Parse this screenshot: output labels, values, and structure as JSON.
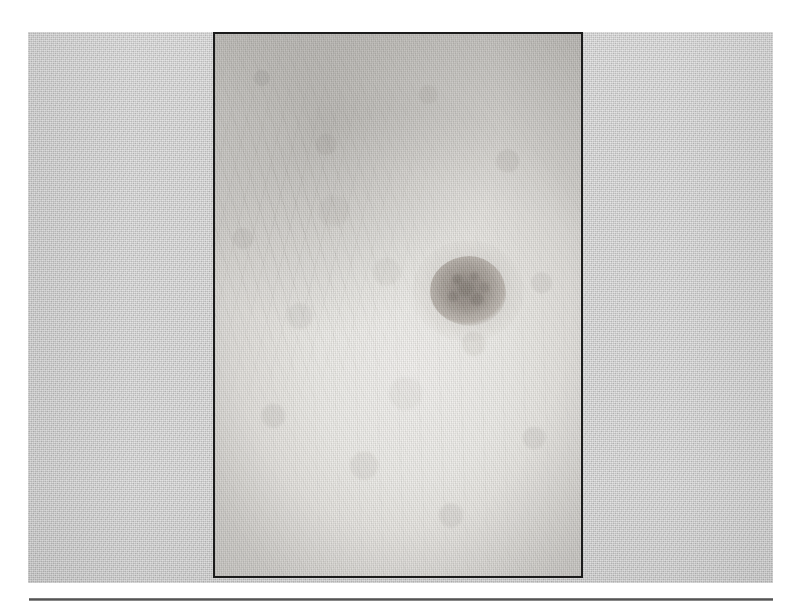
{
  "figure": {
    "kind": "clinical-photograph",
    "caption": "",
    "scan_background_color": "#c9c9c9",
    "photo_border_color": "#1b1b1b",
    "page_background_color": "#ffffff",
    "rule_color": "#4a4a4a"
  },
  "photo": {
    "label": "",
    "skin_tone_color": "#ecebe7",
    "lesion": {
      "name": "pigmented-lesion",
      "label": "",
      "color": "#978f88",
      "halo_color": "#bdb7b0",
      "shape": "round-irregular"
    },
    "annotations": []
  },
  "rule": {
    "label": ""
  }
}
